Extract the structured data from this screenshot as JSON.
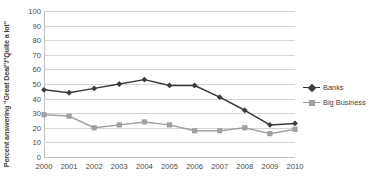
{
  "chart_data": {
    "type": "line",
    "title": "",
    "xlabel": "",
    "ylabel": "Percent answering \"Great Deal\"/\"Quite a lot\"",
    "categories": [
      "2000",
      "2001",
      "2002",
      "2003",
      "2004",
      "2005",
      "2006",
      "2007",
      "2008",
      "2009",
      "2010"
    ],
    "ylim": [
      0,
      100
    ],
    "yticks": [
      "0",
      "10",
      "20",
      "30",
      "40",
      "50",
      "60",
      "70",
      "80",
      "90",
      "100"
    ],
    "grid": true,
    "legend_position": "right",
    "series": [
      {
        "name": "Banks",
        "color": "#3a3a3a",
        "marker": "diamond",
        "values": [
          46,
          44,
          47,
          50,
          53,
          49,
          49,
          41,
          32,
          22,
          23
        ]
      },
      {
        "name": "Big Business",
        "color": "#a0a0a0",
        "marker": "square",
        "values": [
          29,
          28,
          20,
          22,
          24,
          22,
          18,
          18,
          20,
          16,
          19
        ]
      }
    ]
  },
  "legend": {
    "entries": [
      {
        "label": "Banks"
      },
      {
        "label": "Big Business"
      }
    ]
  }
}
